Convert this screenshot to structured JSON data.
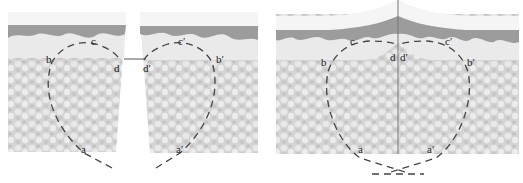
{
  "figure": {
    "colors": {
      "stratum_corneum": "#f2f2f2",
      "epidermis_dark": "#9a9a9a",
      "epidermis_light": "#e6e6e6",
      "dermis": "#d2d2d2",
      "suture": "#444444",
      "label": "#222222"
    },
    "left_panel": {
      "labels": {
        "a": "a",
        "b": "b",
        "c": "c",
        "d": "d",
        "a2": "a′",
        "b2": "b′",
        "c2": "c′",
        "d2": "d′"
      }
    },
    "right_panel": {
      "labels": {
        "a": "a",
        "b": "b",
        "c": "c",
        "d": "d",
        "a2": "a′",
        "b2": "b′",
        "c2": "c′",
        "d2": "d′"
      }
    }
  }
}
